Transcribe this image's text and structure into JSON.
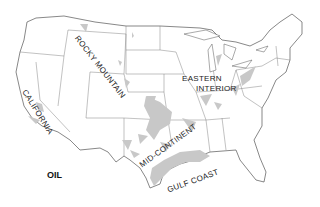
{
  "map": {
    "title": "OIL",
    "regions": [
      {
        "id": "rocky-mountain",
        "label": "ROCKY MOUNTAIN"
      },
      {
        "id": "california",
        "label": "CALIFORNIA"
      },
      {
        "id": "eastern-interior",
        "label_line1": "EASTERN",
        "label_line2": "INTERIOR"
      },
      {
        "id": "mid-continent",
        "label": "MID-CONTINENT"
      },
      {
        "id": "gulf-coast",
        "label": "GULF COAST"
      }
    ],
    "colors": {
      "fill": "#c8c8c8",
      "border": "#555555",
      "background": "#ffffff"
    }
  }
}
